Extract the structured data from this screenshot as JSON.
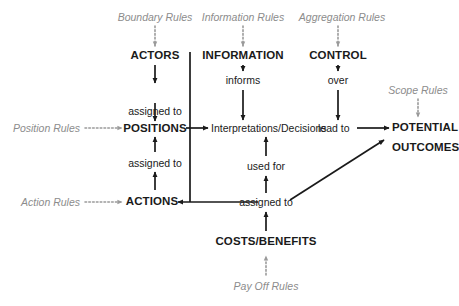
{
  "diagram": {
    "colors": {
      "node_text": "#1a1a1a",
      "rule_text": "#8c8c8c",
      "arrow_solid": "#1a1a1a",
      "arrow_dotted": "#9a9a9a",
      "background": "#ffffff"
    },
    "nodes": {
      "actors": "ACTORS",
      "positions": "POSITIONS",
      "actions": "ACTIONS",
      "information": "INFORMATION",
      "interpretations": "Interpretations/Decisions",
      "control": "CONTROL",
      "costs_benefits": "COSTS/BENEFITS",
      "potential": "POTENTIAL",
      "outcomes": "OUTCOMES"
    },
    "rules": {
      "boundary": "Boundary Rules",
      "information": "Information Rules",
      "aggregation": "Aggregation Rules",
      "scope": "Scope Rules",
      "position": "Position Rules",
      "action": "Action Rules",
      "payoff": "Pay Off Rules"
    },
    "links": {
      "actors_to_positions": "assigned to",
      "actions_to_positions": "assigned to",
      "information_to_interpretations": "informs",
      "control_to_interpretations": "over",
      "interpretations_to_outcomes": "lead to",
      "costs_to_interpretations": "used for",
      "costs_to_actions": "assigned to"
    }
  }
}
